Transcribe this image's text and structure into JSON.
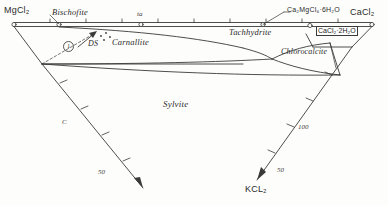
{
  "diagram": {
    "corners": {
      "top_left": "MgCl₂",
      "top_right": "CaCl₂",
      "bottom": "KCL₂"
    },
    "fields": [
      {
        "name": "bischofite",
        "label": "Bischofite"
      },
      {
        "name": "carnallite",
        "label": "Carnallite"
      },
      {
        "name": "tachhydrite",
        "label": "Tachhydrite"
      },
      {
        "name": "chlorocalcite",
        "label": "Chlorocalcite"
      },
      {
        "name": "sylvite",
        "label": "Sylvite"
      },
      {
        "name": "ds",
        "label": "DS"
      }
    ],
    "compounds": [
      {
        "name": "ca2mgcl6",
        "label": "Ca₂MgCl₆·6H₂O"
      },
      {
        "name": "cacl2-2h2o",
        "label": "CaCl₂·2H₂O"
      }
    ],
    "annotations": {
      "field_marker_1": "1",
      "top_tick_label": "ta",
      "left_axis_label": "C",
      "left_axis_tick": "50",
      "right_axis_tick_100": "100",
      "right_axis_tick_50": "50"
    },
    "colors": {
      "line": "#3a3a3a",
      "text": "#2b2b2b",
      "background": "#fdfdfb"
    }
  }
}
